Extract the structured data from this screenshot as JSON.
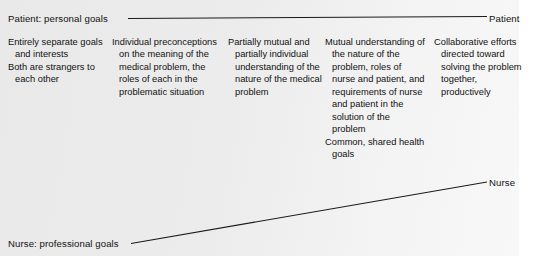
{
  "figure": {
    "background_color": "#e9e9e9",
    "line_color": "#1a1a1a",
    "text_color": "#111111"
  },
  "axes": {
    "patient": {
      "left_label": "Patient: personal goals",
      "right_label": "Patient"
    },
    "nurse": {
      "left_label": "Nurse: professional goals",
      "right_label": "Nurse"
    }
  },
  "columns": [
    {
      "id": "stage-1",
      "paragraphs": [
        "Entirely separate goals and interests",
        "Both are strangers to each other"
      ]
    },
    {
      "id": "stage-2",
      "paragraphs": [
        "Individual preconceptions on the meaning of the medical problem, the roles of each in the problematic situation"
      ]
    },
    {
      "id": "stage-3",
      "paragraphs": [
        "Partially mutual and partially individual understanding of the nature of the medical problem"
      ]
    },
    {
      "id": "stage-4",
      "paragraphs": [
        "Mutual understanding of the nature of the problem, roles of nurse and patient, and requirements of nurse and patient in the solution of the problem",
        "Common, shared health goals"
      ]
    },
    {
      "id": "stage-5",
      "paragraphs": [
        "Collaborative efforts directed toward solving the problem together, productively"
      ]
    }
  ]
}
